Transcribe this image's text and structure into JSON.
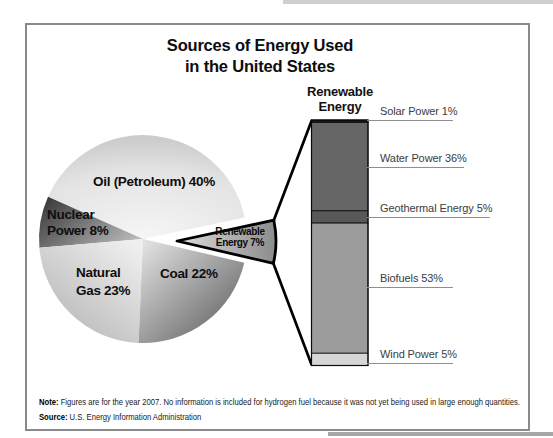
{
  "title": {
    "line1": "Sources of Energy Used",
    "line2": "in the United States"
  },
  "chart_data": {
    "type": "pie",
    "title": "Sources of Energy Used in the United States",
    "year": "2007",
    "pie": {
      "unit": "%",
      "start_angle_deg": 12,
      "slices": [
        {
          "name": "oil",
          "category": "Oil (Petroleum)",
          "value": 40,
          "label": "Oil (Petroleum) 40%",
          "color": "#e2e2e2"
        },
        {
          "name": "nuclear",
          "category": "Nuclear Power",
          "value": 8,
          "label_line1": "Nuclear",
          "label_line2": "Power 8%",
          "color": "#6b6b6b"
        },
        {
          "name": "gas",
          "category": "Natural Gas",
          "value": 23,
          "label_line1": "Natural",
          "label_line2": "Gas 23%",
          "color": "#cdcdcd"
        },
        {
          "name": "coal",
          "category": "Coal",
          "value": 22,
          "label": "Coal 22%",
          "color": "#9a9a9a"
        }
      ],
      "exploded": {
        "name": "renewable",
        "category": "Renewable Energy",
        "value": 7,
        "label_line1": "Renewable",
        "label_line2": "Energy 7%",
        "color": "#aeaeae"
      }
    },
    "bar": {
      "title_line1": "Renewable",
      "title_line2": "Energy",
      "unit": "% of renewable energy",
      "segments": [
        {
          "category": "Solar Power",
          "value": 1,
          "label": "Solar Power 1%",
          "color": "#161616"
        },
        {
          "category": "Water Power",
          "value": 36,
          "label": "Water Power 36%",
          "color": "#666666"
        },
        {
          "category": "Geothermal Energy",
          "value": 5,
          "label": "Geothermal Energy 5%",
          "color": "#585858"
        },
        {
          "category": "Biofuels",
          "value": 53,
          "label": "Biofuels 53%",
          "color": "#9c9c9c"
        },
        {
          "category": "Wind Power",
          "value": 5,
          "label": "Wind Power 5%",
          "color": "#d6d6d6"
        }
      ],
      "legend_position": "right",
      "grid": false
    }
  },
  "note": {
    "label": "Note:",
    "text": "Figures are for the year 2007. No information is included for hydrogen fuel because it was not yet being used in large enough quantities."
  },
  "source": {
    "label": "Source:",
    "text": "U.S. Energy Information Administration"
  }
}
